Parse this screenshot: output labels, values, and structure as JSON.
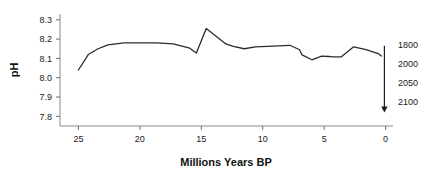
{
  "chart_data": {
    "type": "line",
    "title": "",
    "subtitle": "",
    "xlabel": "Millions Years BP",
    "ylabel": "pH",
    "xlim": [
      26.5,
      -0.6
    ],
    "ylim": [
      7.75,
      8.33
    ],
    "x_ticks": [
      25,
      20,
      15,
      10,
      5,
      0
    ],
    "x_tick_labels": [
      "25",
      "20",
      "15",
      "10",
      "5",
      "0"
    ],
    "y_ticks": [
      8.3,
      8.2,
      8.1,
      8.0,
      7.9,
      7.8
    ],
    "y_tick_labels": [
      "8.3",
      "8.2",
      "8.1",
      "8.0",
      "7.9",
      "7.8"
    ],
    "grid": false,
    "legend": null,
    "x_axis_inverted": true,
    "series": [
      {
        "name": "Ocean surface pH",
        "color": "#2b2b2b",
        "x": [
          25.0,
          24.2,
          23.4,
          22.6,
          21.3,
          20.0,
          18.6,
          17.3,
          16.0,
          15.4,
          14.6,
          13.8,
          13.0,
          12.4,
          11.5,
          10.6,
          9.6,
          8.7,
          7.8,
          7.0,
          6.8,
          6.0,
          5.2,
          4.6,
          4.4,
          3.6,
          2.6,
          1.6,
          0.6,
          0.35
        ],
        "y": [
          8.04,
          8.12,
          8.15,
          8.17,
          8.18,
          8.18,
          8.18,
          8.175,
          8.155,
          8.128,
          8.255,
          8.215,
          8.175,
          8.162,
          8.15,
          8.16,
          8.162,
          8.165,
          8.168,
          8.145,
          8.118,
          8.093,
          8.112,
          8.11,
          8.108,
          8.108,
          8.16,
          8.145,
          8.125,
          8.112
        ]
      }
    ],
    "annotations": [
      {
        "name": "future-projection-arrow",
        "direction": "down",
        "x": 0.1,
        "y_start": 8.165,
        "y_end": 7.82
      }
    ],
    "right_axis_labels": [
      {
        "label": "1800",
        "y": 8.168
      },
      {
        "label": "2000",
        "y": 8.072
      },
      {
        "label": "2050",
        "y": 7.972
      },
      {
        "label": "2100",
        "y": 7.876
      }
    ]
  }
}
